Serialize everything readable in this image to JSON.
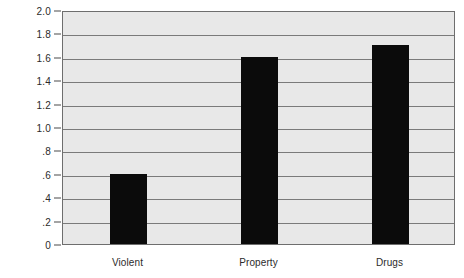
{
  "chart_data": {
    "type": "bar",
    "title": "",
    "subtitle": "",
    "xlabel": "",
    "ylabel": "",
    "categories": [
      "Violent",
      "Property",
      "Drugs"
    ],
    "values": [
      0.6,
      1.6,
      1.7
    ],
    "series": [
      {
        "name": "",
        "values": [
          0.6,
          1.6,
          1.7
        ]
      }
    ],
    "ylim": [
      0,
      2.0
    ],
    "ytick_values": [
      0,
      0.2,
      0.4,
      0.6,
      0.8,
      1.0,
      1.2,
      1.4,
      1.6,
      1.8,
      2.0
    ],
    "ytick_labels": [
      "0",
      ".2",
      ".4",
      ".6",
      ".8",
      "1.0",
      "1.2",
      "1.4",
      "1.6",
      "1.8",
      "2.0"
    ],
    "grid": true,
    "grid_axis": "y",
    "legend": false,
    "legend_position": "none",
    "bar_color": "#0b0b0b",
    "plot_background": "#e8e8e8",
    "gridline_color": "#7a7a7a",
    "frame_color": "#6e6e6e",
    "text_color": "#2b2b2b",
    "page_background": "#ffffff"
  }
}
